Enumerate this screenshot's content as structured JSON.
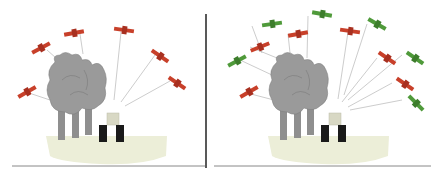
{
  "figure": {
    "panels": [
      {
        "name": "left-panel",
        "description": "Trees partially blocking GPS satellite signals to tractor"
      },
      {
        "name": "right-panel",
        "description": "Additional satellites (green) improve signal availability"
      }
    ],
    "colors": {
      "satellite_red": "#c8402a",
      "satellite_green": "#4f9a3a",
      "tree": "#9a9a9a",
      "tree_outline": "#7a7a7a",
      "ground": "#eceed8",
      "tractor": "#1a1a1a",
      "divider": "#222222",
      "signal_line": "#aaaaaa"
    }
  }
}
